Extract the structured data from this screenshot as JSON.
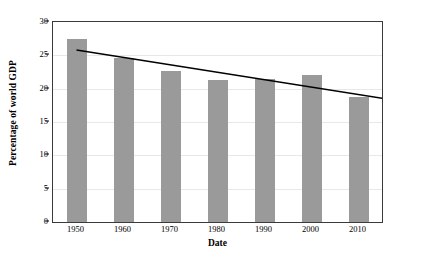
{
  "chart_data": {
    "type": "bar",
    "title": "",
    "xlabel": "Date",
    "ylabel": "Percentage of world GDP",
    "categories": [
      "1950",
      "1960",
      "1970",
      "1980",
      "1990",
      "2000",
      "2010"
    ],
    "values": [
      27.5,
      24.6,
      22.6,
      21.3,
      21.5,
      22.1,
      18.8
    ],
    "series": [
      {
        "name": "Percentage of world GDP",
        "type": "bar",
        "color": "#9a9a9a",
        "values": [
          27.5,
          24.6,
          22.6,
          21.3,
          21.5,
          22.1,
          18.8
        ]
      },
      {
        "name": "Trend line",
        "type": "line",
        "color": "#000000",
        "x": [
          "1950",
          "2010"
        ],
        "values": [
          25.8,
          18.5
        ]
      }
    ],
    "ylim": [
      0,
      30
    ],
    "ytick_values": [
      0,
      5,
      10,
      15,
      20,
      25,
      30
    ],
    "ytick_labels": [
      "0",
      "5",
      "10",
      "15",
      "20",
      "25",
      "30"
    ],
    "xtick_labels": [
      "1950",
      "1960",
      "1970",
      "1980",
      "1990",
      "2000",
      "2010"
    ],
    "grid": true,
    "grid_axis": "y",
    "legend": false,
    "legend_position": "none",
    "bar_color": "#9a9a9a",
    "trendline_color": "#000000",
    "gridline_color": "#e8e8e8",
    "axis_color": "#3a3a3a",
    "background_color": "#ffffff"
  }
}
